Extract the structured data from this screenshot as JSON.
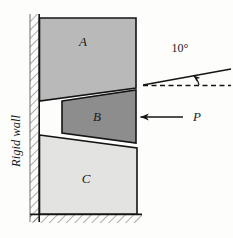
{
  "figure": {
    "blocks": [
      {
        "id": "A",
        "label": "A",
        "fill": "#b9b9b9",
        "label_x": 83,
        "label_y": 46
      },
      {
        "id": "B",
        "label": "B",
        "fill": "#8d8d8d",
        "label_x": 97,
        "label_y": 120
      },
      {
        "id": "C",
        "label": "C",
        "fill": "#e3e3e2",
        "label_x": 86,
        "label_y": 182
      }
    ],
    "wall": {
      "label": "Rigid wall",
      "label_x": 20,
      "label_y": 140
    },
    "ground": {
      "label": "hatched-ground"
    },
    "angle_annotation": {
      "label": "10°",
      "value": 10,
      "unit": "degrees",
      "label_x": 180,
      "label_y": 52
    },
    "force_annotation": {
      "label": "P",
      "label_x": 192,
      "label_y": 120,
      "direction": "left"
    },
    "colors": {
      "block_a": "#b9b9b9",
      "block_b": "#8d8d8d",
      "block_c": "#e3e3e2",
      "outline": "#141414",
      "hatch": "#4a4a4a",
      "background": "#fdfdfc"
    }
  }
}
